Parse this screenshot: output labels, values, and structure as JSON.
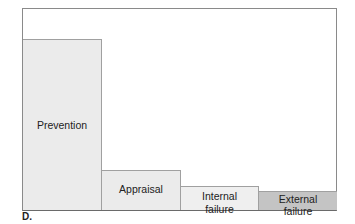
{
  "chart_data": {
    "type": "bar",
    "title": "",
    "xlabel": "",
    "ylabel": "",
    "categories": [
      "Prevention",
      "Appraisal",
      "Internal failure",
      "External failure"
    ],
    "values": [
      171,
      40,
      24,
      19
    ],
    "colors": [
      "#ebebeb",
      "#ebebeb",
      "#efefef",
      "#c4c4c4"
    ],
    "grid": false,
    "legend": false,
    "bar_gap": 0,
    "labels_inside_bars": true
  },
  "bars": [
    {
      "label": "Prevention"
    },
    {
      "label": "Appraisal"
    },
    {
      "label": "Internal\nfailure",
      "line1": "Internal",
      "line2": "failure"
    },
    {
      "label": "External\nfailure",
      "line1": "External",
      "line2": "failure"
    }
  ],
  "panel_label": "D."
}
